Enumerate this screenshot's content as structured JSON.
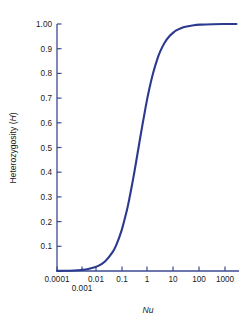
{
  "chart_data": {
    "type": "line",
    "title": "",
    "xlabel": "Nu",
    "ylabel": "Heterozygosity (H)",
    "xscale": "log",
    "xlim": [
      0.0001,
      3000
    ],
    "ylim": [
      0.0,
      1.0
    ],
    "grid": false,
    "legend": null,
    "xticks": [
      {
        "value": 0.0001,
        "label": "0.0001",
        "px": 57,
        "row": 1
      },
      {
        "value": 0.001,
        "label": "0.001",
        "px": 82,
        "row": 2
      },
      {
        "value": 0.01,
        "label": "0.01",
        "px": 96,
        "row": 1
      },
      {
        "value": 0.1,
        "label": "0.1",
        "px": 122,
        "row": 1
      },
      {
        "value": 1,
        "label": "1",
        "px": 147,
        "row": 1
      },
      {
        "value": 10,
        "label": "10",
        "px": 173,
        "row": 1
      },
      {
        "value": 100,
        "label": "100",
        "px": 199,
        "row": 1
      },
      {
        "value": 1000,
        "label": "1000",
        "px": 225,
        "row": 1
      }
    ],
    "yticks": [
      {
        "value": 1.0,
        "label": "1.00"
      },
      {
        "value": 0.9,
        "label": "0.9"
      },
      {
        "value": 0.8,
        "label": "0.8"
      },
      {
        "value": 0.7,
        "label": "0.7"
      },
      {
        "value": 0.6,
        "label": "0.6"
      },
      {
        "value": 0.5,
        "label": "0.5"
      },
      {
        "value": 0.4,
        "label": "0.4"
      },
      {
        "value": 0.3,
        "label": "0.3"
      },
      {
        "value": 0.2,
        "label": "0.2"
      },
      {
        "value": 0.1,
        "label": "0.1"
      }
    ],
    "series": [
      {
        "name": "H = 4Nu/(4Nu+1)",
        "color": "#2b3a8f",
        "linewidth": 2.1,
        "points": [
          {
            "x": 0.0001,
            "y": 0.0004
          },
          {
            "x": 0.0002,
            "y": 0.0008
          },
          {
            "x": 0.0005,
            "y": 0.002
          },
          {
            "x": 0.001,
            "y": 0.004
          },
          {
            "x": 0.002,
            "y": 0.008
          },
          {
            "x": 0.005,
            "y": 0.0196
          },
          {
            "x": 0.01,
            "y": 0.0385
          },
          {
            "x": 0.02,
            "y": 0.0741
          },
          {
            "x": 0.03,
            "y": 0.1071
          },
          {
            "x": 0.05,
            "y": 0.1667
          },
          {
            "x": 0.08,
            "y": 0.2424
          },
          {
            "x": 0.1,
            "y": 0.2857
          },
          {
            "x": 0.15,
            "y": 0.375
          },
          {
            "x": 0.2,
            "y": 0.4444
          },
          {
            "x": 0.3,
            "y": 0.5455
          },
          {
            "x": 0.5,
            "y": 0.6667
          },
          {
            "x": 0.7,
            "y": 0.7368
          },
          {
            "x": 1.0,
            "y": 0.8
          },
          {
            "x": 1.5,
            "y": 0.8571
          },
          {
            "x": 2.0,
            "y": 0.8889
          },
          {
            "x": 3.0,
            "y": 0.9231
          },
          {
            "x": 5.0,
            "y": 0.9524
          },
          {
            "x": 8.0,
            "y": 0.9697
          },
          {
            "x": 10.0,
            "y": 0.9756
          },
          {
            "x": 20.0,
            "y": 0.9877
          },
          {
            "x": 50.0,
            "y": 0.995
          },
          {
            "x": 100.0,
            "y": 0.9975
          },
          {
            "x": 300.0,
            "y": 0.9992
          },
          {
            "x": 1000.0,
            "y": 0.9998
          },
          {
            "x": 3000.0,
            "y": 0.9999
          }
        ]
      }
    ],
    "colors": {
      "curve": "#2b3a8f",
      "axis": "#3b4a92",
      "text": "#1a1a1a",
      "background": "#ffffff"
    }
  },
  "axes": {
    "x_label_text": "Nu",
    "y_label_prefix": "Heterozygosity (",
    "y_label_italic": "H",
    "y_label_suffix": ")"
  }
}
